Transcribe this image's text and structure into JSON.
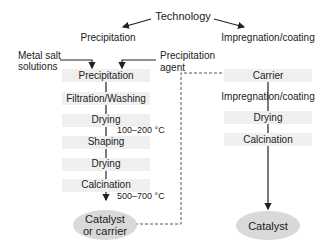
{
  "title": "Technology",
  "branches": {
    "left": "Precipitation",
    "right": "Impregnation/coating"
  },
  "inputs": {
    "metal_salt": [
      "Metal salt",
      "solutions"
    ],
    "precip_agent": [
      "Precipitation",
      "agent"
    ]
  },
  "left_steps": [
    "Precipitation",
    "Filtration/Washing",
    "Drying",
    "Shaping",
    "Drying",
    "Calcination"
  ],
  "left_temps": {
    "drying": "100–200 °C",
    "calcination": "500–700 °C"
  },
  "left_output": [
    "Catalyst",
    "or carrier"
  ],
  "right_steps": [
    "Carrier",
    "Impregnation/coating",
    "Drying",
    "Calcination"
  ],
  "right_output": "Catalyst",
  "colors": {
    "step_box": "#efefef",
    "output_ellipse": "#d9d9d9",
    "line": "#222222",
    "dashed": "#555555"
  }
}
